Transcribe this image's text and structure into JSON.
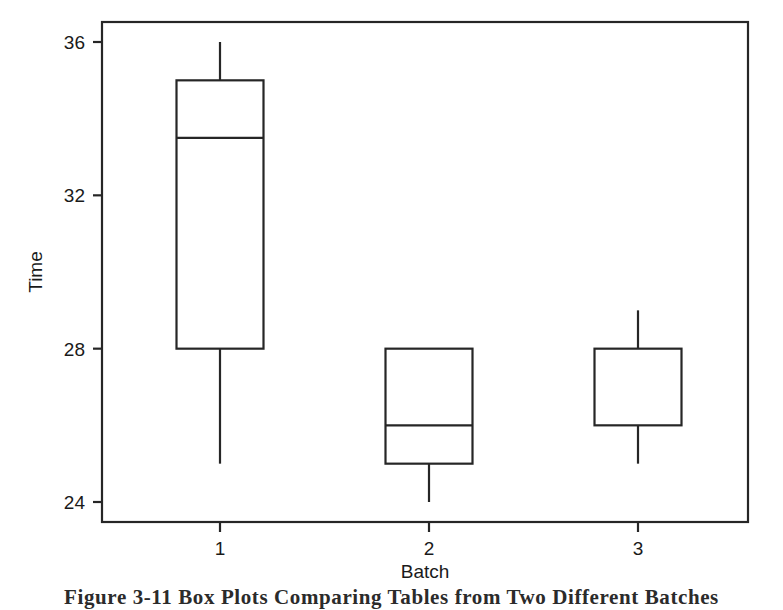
{
  "figure": {
    "caption": "Figure 3-11   Box Plots Comparing Tables from Two Different Batches",
    "background_color": "#ffffff",
    "line_color": "#262626"
  },
  "chart_data": {
    "type": "box",
    "title": "",
    "xlabel": "Batch",
    "ylabel": "Time",
    "categories": [
      "1",
      "2",
      "3"
    ],
    "xtick_labels": [
      "1",
      "2",
      "3"
    ],
    "ytick_labels": [
      "24",
      "28",
      "32",
      "36"
    ],
    "yticks": [
      24,
      28,
      32,
      36
    ],
    "ylim": [
      22.8,
      36.5
    ],
    "xlim": [
      0.4,
      3.6
    ],
    "grid": false,
    "legend": null,
    "boxes": [
      {
        "category": "1",
        "whisker_low": 25,
        "q1": 28,
        "median": 33.5,
        "q3": 35,
        "whisker_high": 36
      },
      {
        "category": "2",
        "whisker_low": 24,
        "q1": 25,
        "median": 26,
        "q3": 28,
        "whisker_high": 28
      },
      {
        "category": "3",
        "whisker_low": 25,
        "q1": 26,
        "median": 26,
        "q3": 28,
        "whisker_high": 29
      }
    ]
  }
}
